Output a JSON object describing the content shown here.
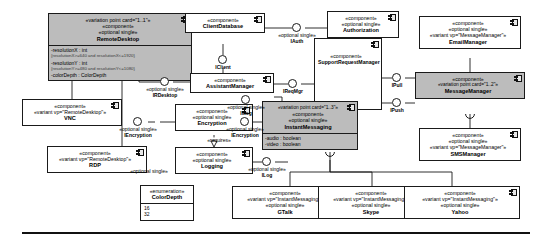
{
  "diagram": {
    "stereotypes": {
      "component": "«component»",
      "optional_single": "«optional single»",
      "enumeration": "«enumeration»",
      "requires": "«requires»"
    },
    "colors": {
      "variation_point_fill": "#bcbcbc",
      "component_fill": "#ffffff",
      "line": "#1a1a1a"
    }
  },
  "components": {
    "remote_desktop": {
      "card": "«variation point card=\"1..1\"»",
      "stereotype": "«component»",
      "optional": "«optional single»",
      "name": "RemoteDesktop",
      "attributes": [
        {
          "text": "-resolutionX : int",
          "constraint": "{resolutionX>=640 and resolutionX<=1920}"
        },
        {
          "text": "-resolutionY : int",
          "constraint": "{resolutionY>=480 and resolutionY<=1080}"
        },
        {
          "text": "-colorDepth : ColorDepth",
          "constraint": ""
        }
      ]
    },
    "vnc": {
      "stereotype": "«component»",
      "variant": "«variant vp=\"RemoteDesktop\"»",
      "name": "VNC"
    },
    "rdp": {
      "stereotype": "«component»",
      "variant": "«variant vp=\"RemoteDesktop\"»",
      "name": "RDP"
    },
    "client_database": {
      "stereotype": "«component»",
      "name": "ClientDatabase"
    },
    "authorization": {
      "stereotype": "«component»",
      "optional": "«optional single»",
      "name": "Authorization"
    },
    "assistant_manager": {
      "stereotype": "«component»",
      "name": "AssistantManager"
    },
    "support_request_manager": {
      "stereotype": "«component»",
      "name": "SupportRequestManager"
    },
    "encryption": {
      "stereotype": "«component»",
      "optional": "«optional single»",
      "name": "Encryption"
    },
    "logging": {
      "stereotype": "«component»",
      "optional": "«optional single»",
      "name": "Logging"
    },
    "instant_messaging": {
      "card": "«variation point card=\"1..3\"»",
      "stereotype": "«component»",
      "optional": "«optional single»",
      "name": "InstantMessaging",
      "attributes": [
        {
          "text": "-audio : boolean",
          "constraint": ""
        },
        {
          "text": "-video : boolean",
          "constraint": ""
        }
      ]
    },
    "message_manager": {
      "stereotype": "«component»",
      "card": "«variation point card=\"1..2\"»",
      "name": "MessageManager"
    },
    "email_manager": {
      "stereotype": "«component»",
      "optional": "«optional single»",
      "variant": "«variant vp=\"MessageManager\"»",
      "name": "EmailManager"
    },
    "sms_manager": {
      "stereotype": "«component»",
      "optional": "«optional single»",
      "variant": "«variant vp=\"MessageManager\"»",
      "name": "SMSManager"
    },
    "gtalk": {
      "stereotype": "«component»",
      "variant": "«variant vp=\"InstantMessaging\"»",
      "optional": "«optional single»",
      "name": "GTalk"
    },
    "skype": {
      "stereotype": "«component»",
      "variant": "«variant vp=\"InstantMessaging\"»",
      "optional": "«optional single»",
      "name": "Skype"
    },
    "yahoo": {
      "stereotype": "«component»",
      "variant": "«variant vp=\"InstantMessaging\"»",
      "optional": "«optional single»",
      "name": "Yahoo"
    }
  },
  "enumeration": {
    "stereotype": "«enumeration»",
    "name": "ColorDepth",
    "literals": [
      "16",
      "32"
    ]
  },
  "interfaces": {
    "i_client": {
      "label": "IClient",
      "qualifier": ""
    },
    "i_auth": {
      "label": "IAuth",
      "qualifier": "«optional single»"
    },
    "i_rdesktop": {
      "label": "IRDesktop",
      "qualifier": "«optional single»"
    },
    "i_encryption_left": {
      "label": "IEncryption",
      "qualifier": "«optional single»"
    },
    "i_encryption_right": {
      "label": "IEncryption",
      "qualifier": "«optional single»"
    },
    "i_req_mgr": {
      "label": "IReqMgr",
      "qualifier": ""
    },
    "i_msg": {
      "label": "IMsg",
      "qualifier": "«optional single»"
    },
    "i_log": {
      "label": "ILog",
      "qualifier": "«optional single»"
    },
    "i_pull": {
      "label": "IPull",
      "qualifier": ""
    },
    "i_push": {
      "label": "IPush",
      "qualifier": ""
    },
    "i_log_lower": {
      "label": "",
      "qualifier": "«optional single»"
    }
  },
  "edge_labels": {
    "requires": "«requires»"
  }
}
